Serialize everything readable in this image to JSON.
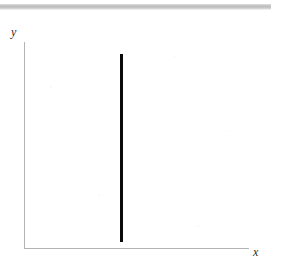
{
  "figure": {
    "background_color": "#ffffff",
    "width": 283,
    "height": 267
  },
  "scan_artifact": {
    "name": "scanner-streak-bar",
    "color": "#c2c2c2"
  },
  "axes": {
    "x_label": "x",
    "y_label": "y",
    "axis_color": "#b4b4b4"
  },
  "chart_data": {
    "type": "line",
    "title": "",
    "subtitle": "",
    "xlabel": "x",
    "ylabel": "y",
    "grid": false,
    "legend": false,
    "legend_position": "none",
    "axis_ticks": {
      "x": [],
      "y": []
    },
    "xlim": [
      0,
      1
    ],
    "ylim": [
      0,
      1
    ],
    "annotations": [],
    "series": [
      {
        "name": "vertical-line",
        "description": "vertical line at constant x",
        "color": "#0a0a0a",
        "linewidth": 3,
        "x": [
          0.435,
          0.435
        ],
        "y": [
          0.94,
          0.03
        ]
      }
    ]
  }
}
